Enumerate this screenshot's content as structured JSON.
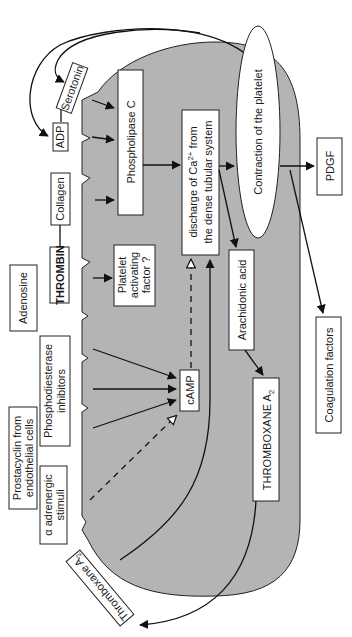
{
  "diagram": {
    "colors": {
      "platelet_fill": "#b4b4b4",
      "box_fill": "#ffffff",
      "line": "#111111"
    },
    "external_agonists": {
      "serotonin": "Serotonin",
      "adp": "ADP",
      "collagen": "Collagen",
      "thrombin": "THROMBIN",
      "adenosine": "Adenosine",
      "phosphodiesterase_line1": "Phosphodiesterase",
      "phosphodiesterase_line2": "inhibitors",
      "prostacyclin_line1": "Prostacyclin from",
      "prostacyclin_line2": "endothelial cells",
      "alpha_line1": "α adrenergic",
      "alpha_line2": "stimuli",
      "thromboxane_out": "Thromboxane A",
      "thromboxane_out_sub": "2"
    },
    "internal": {
      "phospholipase": "Phospholipase C",
      "paf_line1": "Platelet",
      "paf_line2": "activating",
      "paf_line3": "factor ?",
      "camp": "cAMP",
      "calcium_line1_a": "discharge of Ca",
      "calcium_line1_sup": "2+",
      "calcium_line1_b": " from",
      "calcium_line2": "the dense tubular system",
      "arachidonic": "Arachidonic acid",
      "thromboxane_in": "THROMBOXANE A",
      "thromboxane_in_sub": "2",
      "contraction": "Contraction of the platelet"
    },
    "outputs": {
      "pdgf": "PDGF",
      "coagulation": "Coagulation factors"
    }
  }
}
